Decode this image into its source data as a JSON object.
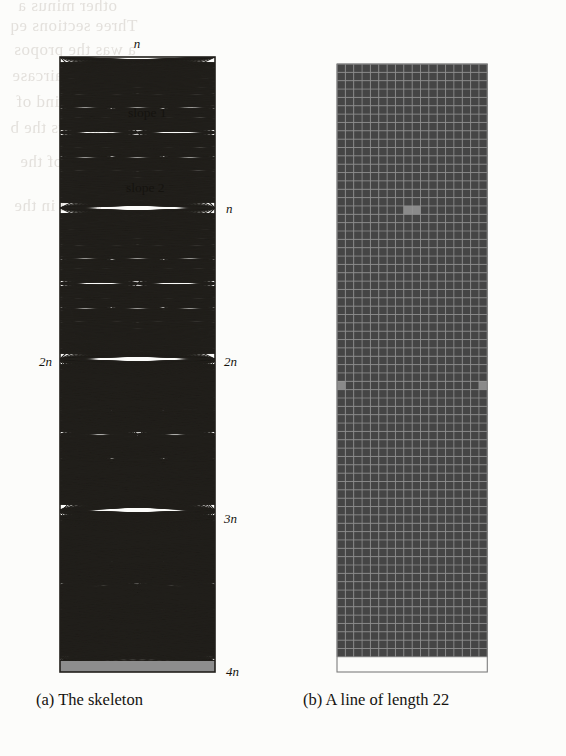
{
  "page": {
    "background_color": "#fcfcfa",
    "ink_color": "#1a1814",
    "width": 566,
    "height": 756
  },
  "figure": {
    "caption_a": "(a) The skeleton",
    "caption_b": "(b) A line of length 22"
  },
  "panel_a": {
    "name": "The skeleton",
    "labels": {
      "top_n": "n",
      "right_n": "n",
      "left_2n": "2n",
      "right_2n": "2n",
      "right_3n": "3n",
      "bottom_4n": "4n",
      "slope_1": "slope 1",
      "slope_2": "slope 2"
    },
    "rect": {
      "x": 60,
      "y": 57,
      "width": 155,
      "height": 615
    },
    "level_y": {
      "n": 57,
      "n_right": 208,
      "two_n": 361,
      "three_n": 518,
      "four_n": 666
    },
    "stroke_color": "#211f1b",
    "band_color": "#8d8d8d",
    "band": {
      "y": 661,
      "height": 11
    }
  },
  "panel_b": {
    "name": "A line of length 22",
    "grid": {
      "x": 337,
      "y": 64,
      "cols": 18,
      "rows": 71,
      "cell": 8.35,
      "line_color": "#8f8f8f",
      "cell_empty": "#fdfdfd",
      "shade_light": "#b9b9b9",
      "shade_mid": "#8a8a8a",
      "shade_dark": "#454545"
    },
    "line_length": 22
  },
  "bleed_text": {
    "lines": [
      "other  minus  a",
      "Three sections eq",
      "a  was  the  propos",
      "y of the  staircase",
      "tht  in  this  kind  of",
      "d  is  always  the  b",
      "the  m  of  the",
      "w  and  in  the"
    ]
  },
  "chart_data": {
    "type": "diagram",
    "levels": [
      "n",
      "2n",
      "3n",
      "4n"
    ],
    "slopes": [
      "slope 1",
      "slope 2"
    ],
    "raster_line_length": 22
  }
}
